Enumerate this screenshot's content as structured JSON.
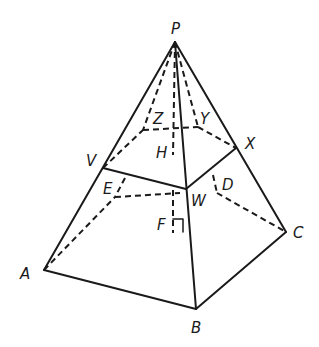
{
  "diagram": {
    "type": "square pyramid with horizontal cross-section",
    "labels": {
      "P": "P",
      "A": "A",
      "B": "B",
      "C": "C",
      "V": "V",
      "W": "W",
      "X": "X",
      "Y": "Y",
      "Z": "Z",
      "H": "H",
      "E": "E",
      "D": "D",
      "F": "F"
    },
    "colors": {
      "line": "#1a1a1a",
      "background": "#ffffff"
    }
  }
}
